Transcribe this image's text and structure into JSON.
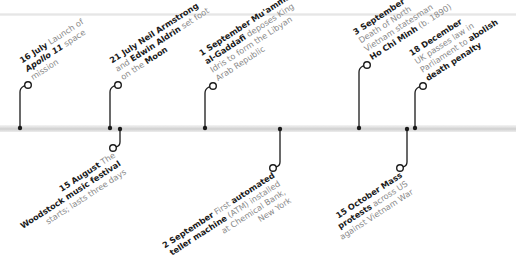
{
  "timeline": {
    "accent_color": "#1a1a1a",
    "muted_text_color": "#8a8a8a",
    "bar_color": "#d6d6d6",
    "events": [
      {
        "id": "16-july",
        "date": "16 July",
        "direction": "up",
        "lines": [
          [
            {
              "t": "16 July",
              "s": "b"
            },
            {
              "t": " Launch of",
              "s": "n"
            }
          ],
          [
            {
              "t": "Apollo 11",
              "s": "i"
            },
            {
              "t": " space",
              "s": "n"
            }
          ],
          [
            {
              "t": "mission",
              "s": "n"
            }
          ]
        ]
      },
      {
        "id": "21-july",
        "date": "21 July",
        "direction": "up",
        "lines": [
          [
            {
              "t": "21 July",
              "s": "b"
            },
            {
              "t": " ",
              "s": "n"
            },
            {
              "t": "Neil Armstrong",
              "s": "b"
            }
          ],
          [
            {
              "t": "and ",
              "s": "n"
            },
            {
              "t": "Edwin Aldrin",
              "s": "b"
            },
            {
              "t": " set foot",
              "s": "n"
            }
          ],
          [
            {
              "t": "on the ",
              "s": "n"
            },
            {
              "t": "Moon",
              "s": "b"
            }
          ]
        ]
      },
      {
        "id": "15-august",
        "date": "15 August",
        "direction": "down",
        "lines": [
          [
            {
              "t": "15 August",
              "s": "b"
            },
            {
              "t": " The",
              "s": "n"
            }
          ],
          [
            {
              "t": "Woodstock music festival",
              "s": "b"
            }
          ],
          [
            {
              "t": "starts; lasts three days",
              "s": "n"
            }
          ]
        ]
      },
      {
        "id": "1-september",
        "date": "1 September",
        "direction": "up",
        "lines": [
          [
            {
              "t": "1 September",
              "s": "b"
            },
            {
              "t": " ",
              "s": "n"
            },
            {
              "t": "Mu'ammar",
              "s": "b"
            }
          ],
          [
            {
              "t": "al-Gaddafi",
              "s": "b"
            },
            {
              "t": " deposes King",
              "s": "n"
            }
          ],
          [
            {
              "t": "Idris to form the Libyan",
              "s": "n"
            }
          ],
          [
            {
              "t": "Arab Republic",
              "s": "n"
            }
          ]
        ]
      },
      {
        "id": "2-september",
        "date": "2 September",
        "direction": "down",
        "lines": [
          [
            {
              "t": "2 September",
              "s": "b"
            },
            {
              "t": " First ",
              "s": "n"
            },
            {
              "t": "automated",
              "s": "b"
            }
          ],
          [
            {
              "t": "teller machine",
              "s": "b"
            },
            {
              "t": " (ATM) installed",
              "s": "n"
            }
          ],
          [
            {
              "t": "at Chemical Bank,",
              "s": "n"
            }
          ],
          [
            {
              "t": "New York",
              "s": "n"
            }
          ]
        ]
      },
      {
        "id": "3-september",
        "date": "3 September",
        "direction": "up",
        "lines": [
          [
            {
              "t": "3 September",
              "s": "b"
            }
          ],
          [
            {
              "t": "Death of North",
              "s": "n"
            }
          ],
          [
            {
              "t": "Vietnam statesman",
              "s": "n"
            }
          ],
          [
            {
              "t": "Ho Chi Minh",
              "s": "b"
            },
            {
              "t": " (b. 1890)",
              "s": "n"
            }
          ]
        ]
      },
      {
        "id": "15-october",
        "date": "15 October",
        "direction": "down",
        "lines": [
          [
            {
              "t": "15 October",
              "s": "b"
            },
            {
              "t": " ",
              "s": "n"
            },
            {
              "t": "Mass",
              "s": "b"
            }
          ],
          [
            {
              "t": "protests",
              "s": "b"
            },
            {
              "t": " across US",
              "s": "n"
            }
          ],
          [
            {
              "t": "against Vietnam War",
              "s": "n"
            }
          ]
        ]
      },
      {
        "id": "18-december",
        "date": "18 December",
        "direction": "up",
        "lines": [
          [
            {
              "t": "18 December",
              "s": "b"
            }
          ],
          [
            {
              "t": "UK passes law in",
              "s": "n"
            }
          ],
          [
            {
              "t": "Parliament to ",
              "s": "n"
            },
            {
              "t": "abolish",
              "s": "b"
            }
          ],
          [
            {
              "t": "death penalty",
              "s": "b"
            }
          ]
        ]
      }
    ]
  }
}
